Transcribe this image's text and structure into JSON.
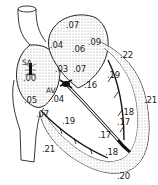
{
  "diagram": {
    "nodes": {
      "sa_node": "SA",
      "av_node": "AV"
    },
    "labels": [
      {
        "id": "ra-top",
        "text": ".07",
        "x": 66,
        "y": 21
      },
      {
        "id": "la-left",
        "text": ".04",
        "x": 50,
        "y": 41
      },
      {
        "id": "la-mid",
        "text": ".06",
        "x": 72,
        "y": 45
      },
      {
        "id": "la-right",
        "text": ".09",
        "x": 88,
        "y": 38
      },
      {
        "id": "lv-top",
        "text": ".22",
        "x": 120,
        "y": 51
      },
      {
        "id": "atrium-low-left",
        "text": ".03",
        "x": 55,
        "y": 65
      },
      {
        "id": "atrium-low-right",
        "text": ".07",
        "x": 73,
        "y": 65
      },
      {
        "id": "sa-time",
        "text": ".00",
        "x": 23,
        "y": 74
      },
      {
        "id": "bundle-left",
        "text": ".16",
        "x": 84,
        "y": 81
      },
      {
        "id": "lv-bundle-upper",
        "text": ".19",
        "x": 107,
        "y": 71
      },
      {
        "id": "ra-lower",
        "text": ".05",
        "x": 24,
        "y": 96
      },
      {
        "id": "av-time",
        "text": ".04",
        "x": 51,
        "y": 95
      },
      {
        "id": "ra-bottom",
        "text": ".07",
        "x": 36,
        "y": 110
      },
      {
        "id": "rv-upper",
        "text": ".19",
        "x": 62,
        "y": 117
      },
      {
        "id": "lv-wall",
        "text": ".21",
        "x": 144,
        "y": 96
      },
      {
        "id": "lv-purkinje",
        "text": ".18",
        "x": 121,
        "y": 108
      },
      {
        "id": "septum-right",
        "text": ".17",
        "x": 117,
        "y": 118
      },
      {
        "id": "septum-left",
        "text": ".17",
        "x": 98,
        "y": 131
      },
      {
        "id": "apex-inner",
        "text": ".18",
        "x": 105,
        "y": 148
      },
      {
        "id": "apex",
        "text": ".20",
        "x": 117,
        "y": 172
      },
      {
        "id": "rv-outer",
        "text": ".21",
        "x": 42,
        "y": 145
      }
    ],
    "colors": {
      "stroke": "#222222",
      "shade": "#d8d8d8",
      "fiber": "#111111"
    }
  }
}
